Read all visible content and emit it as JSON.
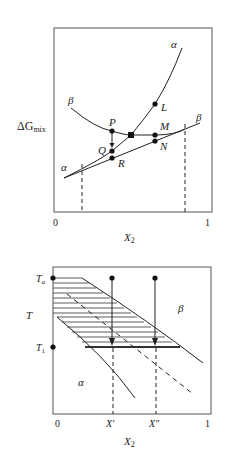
{
  "top_panel": {
    "y_axis_label": "ΔG",
    "y_axis_sub": "mix",
    "x_axis_label": "X",
    "x_axis_sub": "2",
    "x_ticks": [
      "0",
      "1"
    ],
    "curve_labels": {
      "alpha_upper": "α",
      "beta_left": "β",
      "beta_right": "β",
      "alpha_left": "α"
    },
    "points": [
      "P",
      "Q",
      "R",
      "L",
      "M",
      "N"
    ]
  },
  "bottom_panel": {
    "y_axis_label": "T",
    "y_ticks": [
      {
        "main": "T",
        "sub": "a"
      },
      {
        "main": "T",
        "sub": "1"
      }
    ],
    "x_axis_label": "X",
    "x_axis_sub": "2",
    "x_ticks": [
      "0",
      "X′",
      "X″",
      "1"
    ],
    "region_labels": {
      "alpha": "α",
      "beta": "β"
    }
  }
}
